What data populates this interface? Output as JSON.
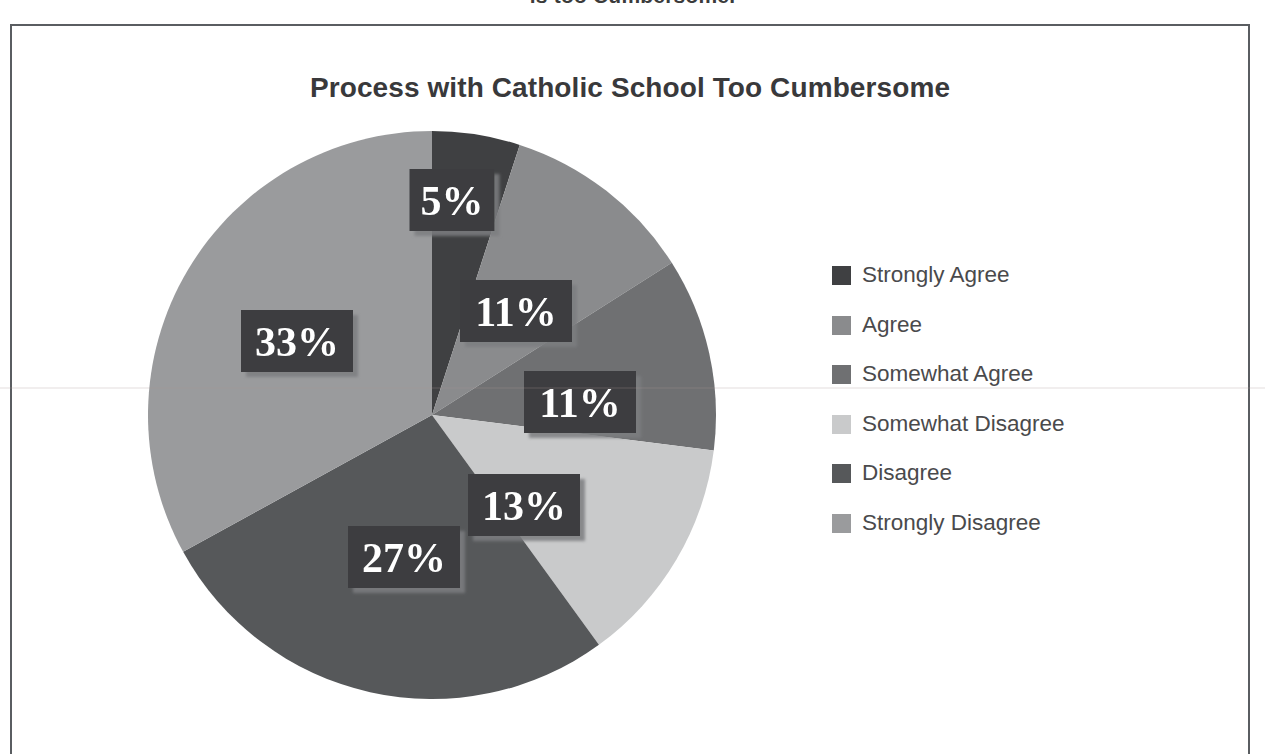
{
  "page": {
    "clipped_caption_above": "is too Cumbersome.",
    "background_color": "#ffffff",
    "frame_border_color": "#5a5d61"
  },
  "chart_data": {
    "type": "pie",
    "title": "Process with Catholic School Too Cumbersome",
    "xlabel": "",
    "ylabel": "",
    "legend_position": "right",
    "grid": false,
    "start_angle_deg": 0,
    "direction": "clockwise",
    "categories": [
      "Strongly Agree",
      "Agree",
      "Somewhat Agree",
      "Somewhat Disagree",
      "Disagree",
      "Strongly Disagree"
    ],
    "values": [
      5,
      11,
      11,
      13,
      27,
      33
    ],
    "data_labels": [
      "5%",
      "11%",
      "11%",
      "13%",
      "27%",
      "33%"
    ],
    "colors": [
      "#3f4042",
      "#8a8b8d",
      "#6f7072",
      "#c9cacb",
      "#56585a",
      "#9a9b9d"
    ],
    "total": 100,
    "units": "percent"
  },
  "labels": {
    "box_fill": "#3d3e40",
    "text_color": "#ffffff",
    "items": [
      {
        "text": "5%",
        "x": 452,
        "y": 200
      },
      {
        "text": "11%",
        "x": 516,
        "y": 311
      },
      {
        "text": "11%",
        "x": 580,
        "y": 402
      },
      {
        "text": "13%",
        "x": 524,
        "y": 505
      },
      {
        "text": "27%",
        "x": 404,
        "y": 557
      },
      {
        "text": "33%",
        "x": 297,
        "y": 341
      }
    ]
  },
  "legend": {
    "items": [
      {
        "label": "Strongly Agree",
        "color": "#3f4042"
      },
      {
        "label": "Agree",
        "color": "#8a8b8d"
      },
      {
        "label": "Somewhat Agree",
        "color": "#6f7072"
      },
      {
        "label": "Somewhat Disagree",
        "color": "#c9cacb"
      },
      {
        "label": "Disagree",
        "color": "#56585a"
      },
      {
        "label": "Strongly Disagree",
        "color": "#9a9b9d"
      }
    ]
  },
  "geometry": {
    "center_x": 432,
    "center_y": 415,
    "radius": 284
  }
}
